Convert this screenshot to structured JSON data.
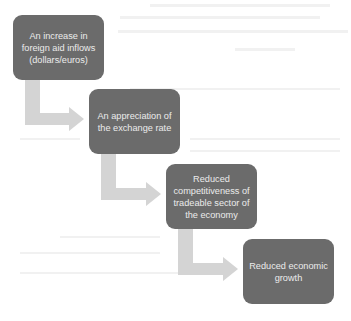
{
  "diagram": {
    "type": "process-flow",
    "direction": "staircase-down-right",
    "colors": {
      "box_fill": "#6b6b6b",
      "box_text": "#ececec",
      "arrow_fill": "#d4d4d4",
      "background": "#ffffff"
    },
    "steps": [
      {
        "label": "An increase in foreign aid inflows (dollars/euros)"
      },
      {
        "label": "An appreciation of the exchange rate"
      },
      {
        "label": "Reduced competitiveness of tradeable sector of the economy"
      },
      {
        "label": "Reduced economic growth"
      }
    ],
    "connectors": [
      {
        "from": 0,
        "to": 1,
        "shape": "bent-arrow"
      },
      {
        "from": 1,
        "to": 2,
        "shape": "bent-arrow"
      },
      {
        "from": 2,
        "to": 3,
        "shape": "bent-arrow"
      }
    ]
  }
}
